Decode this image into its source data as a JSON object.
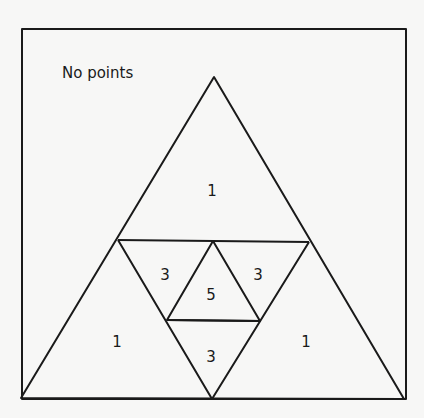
{
  "diagram": {
    "title": "No points",
    "regions": {
      "top": "1",
      "left_inner": "3",
      "center": "5",
      "right_inner": "3",
      "bottom_inner": "3",
      "bottom_left": "1",
      "bottom_right": "1"
    },
    "colors": {
      "line": "#1a1a1a",
      "background": "#f7f7f6"
    }
  }
}
